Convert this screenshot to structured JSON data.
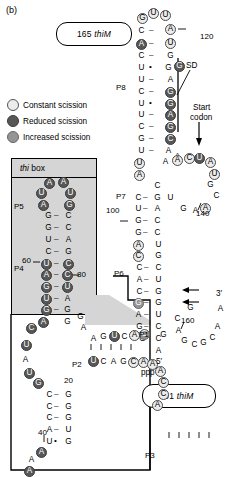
{
  "figure": {
    "panel_label": "(b)",
    "type": "RNA secondary structure diagram",
    "molecule": "thiM riboswitch"
  },
  "callouts": [
    {
      "name": "construct-165",
      "number": "165",
      "gene": "thiM",
      "x": 56,
      "y": 22,
      "w": 74,
      "h": 22
    },
    {
      "name": "construct-91",
      "number": "91",
      "gene": "thiM",
      "x": 142,
      "y": 384,
      "w": 72,
      "h": 22
    }
  ],
  "legend": {
    "title": "",
    "items": [
      {
        "label": "Constant scission",
        "swatch": "const",
        "color": "#ececec"
      },
      {
        "label": "Reduced scission",
        "swatch": "red",
        "color": "#575757"
      },
      {
        "label": "Increased scission",
        "swatch": "inc",
        "color": "#949494"
      }
    ]
  },
  "boxes": [
    {
      "name": "thi-box",
      "label_italic": "thi",
      "label_rest": " box",
      "fill": "#d5d5d5",
      "stroke": "#000000"
    }
  ],
  "annotations": [
    {
      "name": "sd-label",
      "text": "SD",
      "x": 186,
      "y": 62
    },
    {
      "name": "start-codon-label-1",
      "text": "Start",
      "x": 193,
      "y": 104
    },
    {
      "name": "start-codon-label-2",
      "text": "codon",
      "x": 190,
      "y": 114
    },
    {
      "name": "five-prime-label",
      "text": "5′",
      "x": 156,
      "y": 358
    },
    {
      "name": "ppp-label",
      "text": "ppp",
      "x": 141,
      "y": 369
    },
    {
      "name": "three-prime-label",
      "text": "3′",
      "x": 216,
      "y": 290
    }
  ],
  "helices": [
    {
      "name": "P1",
      "label": "P1",
      "x": 139,
      "y": 331
    },
    {
      "name": "P2",
      "label": "P2",
      "x": 72,
      "y": 361
    },
    {
      "name": "P3",
      "label": "P3",
      "x": 145,
      "y": 452
    },
    {
      "name": "P4",
      "label": "P4",
      "x": 14,
      "y": 265
    },
    {
      "name": "P5",
      "label": "P5",
      "x": 14,
      "y": 203
    },
    {
      "name": "P6",
      "label": "P6",
      "x": 114,
      "y": 270
    },
    {
      "name": "P7",
      "label": "P7",
      "x": 116,
      "y": 193
    },
    {
      "name": "P8",
      "label": "P8",
      "x": 116,
      "y": 84
    }
  ],
  "position_numbers": [
    {
      "name": "pos-120",
      "text": "120",
      "x": 200,
      "y": 33
    },
    {
      "name": "pos-100",
      "text": "100",
      "x": 106,
      "y": 207
    },
    {
      "name": "pos-140",
      "text": "140",
      "x": 196,
      "y": 210
    },
    {
      "name": "pos-160",
      "text": "160",
      "x": 181,
      "y": 317
    },
    {
      "name": "pos-80",
      "text": "80",
      "x": 77,
      "y": 271
    },
    {
      "name": "pos-60",
      "text": "60",
      "x": 22,
      "y": 257
    },
    {
      "name": "pos-40",
      "text": "40",
      "x": 38,
      "y": 429
    },
    {
      "name": "pos-20",
      "text": "20",
      "x": 64,
      "y": 377
    }
  ],
  "sequence_labels": {
    "p8_left": [
      "G",
      "C",
      "A",
      "C",
      "U",
      "U",
      "C",
      "U",
      "U",
      "C",
      "G",
      "U",
      "U",
      "A"
    ],
    "p8_right": [
      "U",
      "U",
      "A",
      "U",
      "G",
      "G",
      "A",
      "G",
      "G",
      "A",
      "G",
      "G",
      "C",
      "A",
      "A"
    ],
    "p1_top": [
      "A",
      "G",
      "U",
      "C",
      "A",
      "C"
    ],
    "p1_bottom": [
      "U",
      "C",
      "A",
      "G",
      "C",
      "A",
      "A",
      "A",
      "C",
      "C",
      "A"
    ],
    "p3_top": [
      "C",
      "C",
      "U",
      "U",
      "C"
    ],
    "p3_bottom": [
      "G",
      "G",
      "A",
      "A",
      "G"
    ],
    "three_prime_tail": [
      "G",
      "C",
      "G",
      "C",
      "A",
      "A"
    ]
  },
  "nucleotides": [
    {
      "b": "G",
      "x": 137,
      "y": 13,
      "s": "const"
    },
    {
      "b": "U",
      "x": 148,
      "y": 8,
      "s": "const"
    },
    {
      "b": "U",
      "x": 160,
      "y": 10,
      "s": "const"
    },
    {
      "b": "C",
      "x": 136,
      "y": 26,
      "s": "plain"
    },
    {
      "b": "A",
      "x": 165,
      "y": 24,
      "s": "const"
    },
    {
      "b": "A",
      "x": 136,
      "y": 39,
      "s": "red"
    },
    {
      "b": "U",
      "x": 165,
      "y": 38,
      "s": "const"
    },
    {
      "b": "C",
      "x": 136,
      "y": 51,
      "s": "plain"
    },
    {
      "b": "G",
      "x": 165,
      "y": 51,
      "s": "plain"
    },
    {
      "b": "U",
      "x": 136,
      "y": 63,
      "s": "plain"
    },
    {
      "b": "G",
      "x": 163,
      "y": 63,
      "s": "plain"
    },
    {
      "b": "G",
      "x": 174,
      "y": 61,
      "s": "red"
    },
    {
      "b": "U",
      "x": 136,
      "y": 75,
      "s": "plain"
    },
    {
      "b": "A",
      "x": 165,
      "y": 75,
      "s": "plain"
    },
    {
      "b": "C",
      "x": 136,
      "y": 87,
      "s": "plain"
    },
    {
      "b": "G",
      "x": 165,
      "y": 87,
      "s": "red"
    },
    {
      "b": "U",
      "x": 136,
      "y": 99,
      "s": "plain"
    },
    {
      "b": "G",
      "x": 165,
      "y": 99,
      "s": "red"
    },
    {
      "b": "U",
      "x": 136,
      "y": 110,
      "s": "plain"
    },
    {
      "b": "A",
      "x": 165,
      "y": 110,
      "s": "red"
    },
    {
      "b": "C",
      "x": 136,
      "y": 122,
      "s": "plain"
    },
    {
      "b": "G",
      "x": 165,
      "y": 122,
      "s": "red"
    },
    {
      "b": "G",
      "x": 136,
      "y": 134,
      "s": "plain"
    },
    {
      "b": "C",
      "x": 165,
      "y": 134,
      "s": "red"
    },
    {
      "b": "U",
      "x": 136,
      "y": 146,
      "s": "plain"
    },
    {
      "b": "A",
      "x": 163,
      "y": 146,
      "s": "plain"
    },
    {
      "b": "A",
      "x": 172,
      "y": 152,
      "s": "plain"
    },
    {
      "b": "U",
      "x": 134,
      "y": 158,
      "s": "const"
    },
    {
      "b": "A",
      "x": 160,
      "y": 157,
      "s": "plain"
    },
    {
      "b": "A",
      "x": 172,
      "y": 155,
      "s": "const"
    },
    {
      "b": "C",
      "x": 184,
      "y": 153,
      "s": "const"
    },
    {
      "b": "U",
      "x": 194,
      "y": 153,
      "s": "red"
    },
    {
      "b": "A",
      "x": 205,
      "y": 157,
      "s": "const"
    },
    {
      "b": "A",
      "x": 134,
      "y": 170,
      "s": "const"
    },
    {
      "b": "U",
      "x": 209,
      "y": 169,
      "s": "const"
    },
    {
      "b": "C",
      "x": 152,
      "y": 181,
      "s": "plain"
    },
    {
      "b": "G",
      "x": 205,
      "y": 180,
      "s": "plain"
    },
    {
      "b": "C",
      "x": 133,
      "y": 193,
      "s": "plain"
    },
    {
      "b": "G",
      "x": 152,
      "y": 193,
      "s": "plain"
    },
    {
      "b": "U",
      "x": 165,
      "y": 193,
      "s": "plain"
    },
    {
      "b": "C",
      "x": 211,
      "y": 191,
      "s": "plain"
    },
    {
      "b": "U",
      "x": 133,
      "y": 204,
      "s": "plain"
    },
    {
      "b": "A",
      "x": 152,
      "y": 204,
      "s": "plain"
    },
    {
      "b": "G",
      "x": 178,
      "y": 204,
      "s": "plain"
    },
    {
      "b": "A",
      "x": 190,
      "y": 206,
      "s": "plain"
    },
    {
      "b": "A",
      "x": 200,
      "y": 203,
      "s": "const"
    },
    {
      "b": "G",
      "x": 133,
      "y": 216,
      "s": "plain"
    },
    {
      "b": "C",
      "x": 152,
      "y": 216,
      "s": "plain"
    },
    {
      "b": "G",
      "x": 133,
      "y": 228,
      "s": "plain"
    },
    {
      "b": "C",
      "x": 152,
      "y": 228,
      "s": "plain"
    },
    {
      "b": "A",
      "x": 133,
      "y": 240,
      "s": "const"
    },
    {
      "b": "U",
      "x": 153,
      "y": 240,
      "s": "plain"
    },
    {
      "b": "C",
      "x": 133,
      "y": 251,
      "s": "const"
    },
    {
      "b": "G",
      "x": 153,
      "y": 251,
      "s": "plain"
    },
    {
      "b": "C",
      "x": 134,
      "y": 263,
      "s": "plain"
    },
    {
      "b": "C",
      "x": 153,
      "y": 263,
      "s": "plain"
    },
    {
      "b": "A",
      "x": 134,
      "y": 275,
      "s": "plain"
    },
    {
      "b": "U",
      "x": 153,
      "y": 275,
      "s": "plain"
    },
    {
      "b": "C",
      "x": 134,
      "y": 287,
      "s": "plain"
    },
    {
      "b": "G",
      "x": 153,
      "y": 287,
      "s": "plain"
    },
    {
      "b": "G",
      "x": 133,
      "y": 298,
      "s": "inc"
    },
    {
      "b": "G",
      "x": 153,
      "y": 298,
      "s": "plain"
    },
    {
      "b": "A",
      "x": 133,
      "y": 310,
      "s": "plain"
    },
    {
      "b": "U",
      "x": 153,
      "y": 310,
      "s": "plain"
    },
    {
      "b": "G",
      "x": 134,
      "y": 322,
      "s": "plain"
    },
    {
      "b": "C",
      "x": 153,
      "y": 322,
      "s": "plain"
    },
    {
      "b": "G",
      "x": 137,
      "y": 334,
      "s": "plain"
    },
    {
      "b": "C",
      "x": 153,
      "y": 334,
      "s": "plain"
    },
    {
      "b": "A",
      "x": 153,
      "y": 346,
      "s": "plain"
    },
    {
      "b": "G",
      "x": 158,
      "y": 330,
      "s": "plain"
    },
    {
      "b": "C",
      "x": 172,
      "y": 314,
      "s": "plain"
    },
    {
      "b": "A",
      "x": 173,
      "y": 326,
      "s": "plain"
    },
    {
      "b": "G",
      "x": 179,
      "y": 336,
      "s": "plain"
    },
    {
      "b": "C",
      "x": 189,
      "y": 340,
      "s": "plain"
    },
    {
      "b": "G",
      "x": 198,
      "y": 338,
      "s": "plain"
    },
    {
      "b": "C",
      "x": 207,
      "y": 333,
      "s": "plain"
    },
    {
      "b": "A",
      "x": 212,
      "y": 322,
      "s": "plain"
    },
    {
      "b": "A",
      "x": 215,
      "y": 304,
      "s": "plain"
    },
    {
      "b": "G",
      "x": 185,
      "y": 303,
      "s": "plain"
    },
    {
      "b": "A",
      "x": 44,
      "y": 178,
      "s": "red"
    },
    {
      "b": "A",
      "x": 58,
      "y": 177,
      "s": "red"
    },
    {
      "b": "U",
      "x": 36,
      "y": 188,
      "s": "red"
    },
    {
      "b": "U",
      "x": 65,
      "y": 188,
      "s": "red"
    },
    {
      "b": "A",
      "x": 38,
      "y": 200,
      "s": "red"
    },
    {
      "b": "G",
      "x": 64,
      "y": 200,
      "s": "red"
    },
    {
      "b": "G",
      "x": 43,
      "y": 211,
      "s": "plain"
    },
    {
      "b": "C",
      "x": 63,
      "y": 211,
      "s": "plain"
    },
    {
      "b": "G",
      "x": 43,
      "y": 223,
      "s": "plain"
    },
    {
      "b": "C",
      "x": 63,
      "y": 223,
      "s": "plain"
    },
    {
      "b": "U",
      "x": 43,
      "y": 235,
      "s": "plain"
    },
    {
      "b": "A",
      "x": 63,
      "y": 235,
      "s": "plain"
    },
    {
      "b": "C",
      "x": 43,
      "y": 247,
      "s": "plain"
    },
    {
      "b": "G",
      "x": 63,
      "y": 247,
      "s": "plain"
    },
    {
      "b": "U",
      "x": 41,
      "y": 259,
      "s": "red"
    },
    {
      "b": "C",
      "x": 63,
      "y": 259,
      "s": "red"
    },
    {
      "b": "A",
      "x": 41,
      "y": 270,
      "s": "red"
    },
    {
      "b": "C",
      "x": 62,
      "y": 270,
      "s": "red"
    },
    {
      "b": "G",
      "x": 41,
      "y": 282,
      "s": "red"
    },
    {
      "b": "U",
      "x": 62,
      "y": 282,
      "s": "red"
    },
    {
      "b": "U",
      "x": 41,
      "y": 294,
      "s": "red"
    },
    {
      "b": "A",
      "x": 62,
      "y": 294,
      "s": "plain"
    },
    {
      "b": "G",
      "x": 41,
      "y": 305,
      "s": "red"
    },
    {
      "b": "G",
      "x": 62,
      "y": 305,
      "s": "plain"
    },
    {
      "b": "A",
      "x": 38,
      "y": 317,
      "s": "red"
    },
    {
      "b": "G",
      "x": 62,
      "y": 317,
      "s": "plain"
    },
    {
      "b": "C",
      "x": 26,
      "y": 323,
      "s": "red"
    },
    {
      "b": "G",
      "x": 75,
      "y": 312,
      "s": "plain"
    },
    {
      "b": "A",
      "x": 78,
      "y": 323,
      "s": "plain"
    },
    {
      "b": "U",
      "x": 21,
      "y": 340,
      "s": "red"
    },
    {
      "b": "A",
      "x": 20,
      "y": 355,
      "s": "plain"
    },
    {
      "b": "U",
      "x": 24,
      "y": 368,
      "s": "red"
    },
    {
      "b": "G",
      "x": 33,
      "y": 378,
      "s": "red"
    },
    {
      "b": "A",
      "x": 88,
      "y": 334,
      "s": "plain"
    },
    {
      "b": "G",
      "x": 98,
      "y": 332,
      "s": "plain"
    },
    {
      "b": "U",
      "x": 109,
      "y": 331,
      "s": "red"
    },
    {
      "b": "C",
      "x": 119,
      "y": 332,
      "s": "plain"
    },
    {
      "b": "A",
      "x": 129,
      "y": 330,
      "s": "const"
    },
    {
      "b": "C",
      "x": 139,
      "y": 329,
      "s": "inc"
    },
    {
      "b": "U",
      "x": 88,
      "y": 356,
      "s": "red"
    },
    {
      "b": "C",
      "x": 98,
      "y": 357,
      "s": "plain"
    },
    {
      "b": "A",
      "x": 108,
      "y": 357,
      "s": "plain"
    },
    {
      "b": "G",
      "x": 118,
      "y": 357,
      "s": "plain"
    },
    {
      "b": "C",
      "x": 128,
      "y": 357,
      "s": "const"
    },
    {
      "b": "A",
      "x": 138,
      "y": 357,
      "s": "const"
    },
    {
      "b": "A",
      "x": 147,
      "y": 359,
      "s": "const"
    },
    {
      "b": "A",
      "x": 155,
      "y": 366,
      "s": "const"
    },
    {
      "b": "C",
      "x": 158,
      "y": 377,
      "s": "const"
    },
    {
      "b": "C",
      "x": 158,
      "y": 389,
      "s": "const"
    },
    {
      "b": "A",
      "x": 152,
      "y": 400,
      "s": "const"
    },
    {
      "b": "C",
      "x": 44,
      "y": 390,
      "s": "plain"
    },
    {
      "b": "G",
      "x": 63,
      "y": 390,
      "s": "plain"
    },
    {
      "b": "C",
      "x": 44,
      "y": 402,
      "s": "plain"
    },
    {
      "b": "G",
      "x": 63,
      "y": 402,
      "s": "plain"
    },
    {
      "b": "C",
      "x": 44,
      "y": 413,
      "s": "plain"
    },
    {
      "b": "G",
      "x": 63,
      "y": 413,
      "s": "plain"
    },
    {
      "b": "A",
      "x": 44,
      "y": 425,
      "s": "plain"
    },
    {
      "b": "U",
      "x": 63,
      "y": 425,
      "s": "plain"
    },
    {
      "b": "U",
      "x": 44,
      "y": 437,
      "s": "plain"
    },
    {
      "b": "G",
      "x": 63,
      "y": 437,
      "s": "plain"
    },
    {
      "b": "A",
      "x": 36,
      "y": 447,
      "s": "red"
    },
    {
      "b": "A",
      "x": 26,
      "y": 455,
      "s": "plain"
    },
    {
      "b": "A",
      "x": 24,
      "y": 466,
      "s": "red"
    }
  ],
  "pairings": [
    {
      "kind": "dash",
      "x": 149,
      "y": 26
    },
    {
      "kind": "dash",
      "x": 149,
      "y": 39
    },
    {
      "kind": "dash",
      "x": 149,
      "y": 51
    },
    {
      "kind": "dot",
      "x": 149,
      "y": 63
    },
    {
      "kind": "dash",
      "x": 149,
      "y": 75
    },
    {
      "kind": "dash",
      "x": 149,
      "y": 87
    },
    {
      "kind": "dot",
      "x": 149,
      "y": 99
    },
    {
      "kind": "dash",
      "x": 149,
      "y": 110
    },
    {
      "kind": "dash",
      "x": 149,
      "y": 122
    },
    {
      "kind": "dash",
      "x": 149,
      "y": 134
    },
    {
      "kind": "dash",
      "x": 149,
      "y": 146
    },
    {
      "kind": "dash",
      "x": 54,
      "y": 211
    },
    {
      "kind": "dash",
      "x": 54,
      "y": 223
    },
    {
      "kind": "dash",
      "x": 54,
      "y": 235
    },
    {
      "kind": "dash",
      "x": 54,
      "y": 247
    },
    {
      "kind": "dash",
      "x": 54,
      "y": 259
    },
    {
      "kind": "dash",
      "x": 54,
      "y": 270
    },
    {
      "kind": "dash",
      "x": 54,
      "y": 282
    },
    {
      "kind": "dash",
      "x": 54,
      "y": 294
    },
    {
      "kind": "dash",
      "x": 54,
      "y": 305
    },
    {
      "kind": "dash",
      "x": 143,
      "y": 193
    },
    {
      "kind": "dash",
      "x": 143,
      "y": 204
    },
    {
      "kind": "dash",
      "x": 143,
      "y": 216
    },
    {
      "kind": "dash",
      "x": 143,
      "y": 228
    },
    {
      "kind": "dash",
      "x": 144,
      "y": 263
    },
    {
      "kind": "dash",
      "x": 144,
      "y": 275
    },
    {
      "kind": "dash",
      "x": 144,
      "y": 287
    },
    {
      "kind": "dash",
      "x": 144,
      "y": 298
    },
    {
      "kind": "dash",
      "x": 144,
      "y": 310
    },
    {
      "kind": "dash",
      "x": 144,
      "y": 322
    },
    {
      "kind": "dash",
      "x": 54,
      "y": 390
    },
    {
      "kind": "dash",
      "x": 54,
      "y": 402
    },
    {
      "kind": "dash",
      "x": 54,
      "y": 413
    },
    {
      "kind": "dash",
      "x": 54,
      "y": 425
    },
    {
      "kind": "dot",
      "x": 54,
      "y": 437
    }
  ],
  "arrows": [
    {
      "name": "start-codon-arrow",
      "x": 199,
      "y": 126,
      "dir": "down"
    },
    {
      "name": "insert-arrow-g",
      "x": 192,
      "y": 285,
      "dir": "left",
      "letter": "G"
    },
    {
      "name": "insert-arrow-u",
      "x": 192,
      "y": 297,
      "dir": "left",
      "letter": "U"
    },
    {
      "name": "pos-140-tick",
      "x": 196,
      "y": 208,
      "dir": "tick"
    }
  ]
}
